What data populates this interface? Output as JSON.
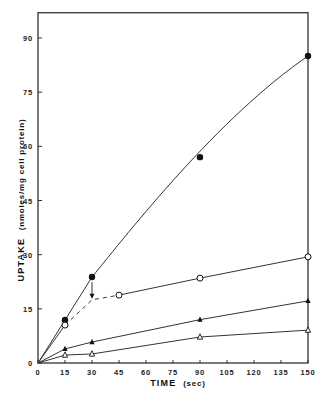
{
  "chart_data": {
    "type": "line",
    "title": "",
    "xlabel": "TIME (sec)",
    "ylabel_main": "UPTAKE",
    "ylabel_units": "(nmoles/mg cell protein)",
    "xlim": [
      0,
      150
    ],
    "ylim": [
      0,
      97
    ],
    "x_ticks": [
      0,
      15,
      30,
      45,
      60,
      75,
      90,
      105,
      120,
      135,
      150
    ],
    "y_ticks": [
      0,
      15,
      30,
      45,
      60,
      75,
      90
    ],
    "grid": false,
    "legend": "none",
    "series": [
      {
        "name": "filled circles",
        "marker": "filled-circle",
        "line": "solid smooth curve",
        "x": [
          0,
          15,
          30,
          90,
          150
        ],
        "y": [
          0,
          11.9,
          23.8,
          57,
          85
        ]
      },
      {
        "name": "open circles",
        "marker": "open-circle",
        "line": "solid 0-15, dashed 15-45 (arrow from filled 30s point down to 30s), solid 45-150",
        "x": [
          0,
          15,
          30,
          45,
          90,
          150
        ],
        "y": [
          0,
          10.5,
          17.5,
          18.8,
          23.5,
          29.4
        ]
      },
      {
        "name": "filled triangles",
        "marker": "filled-triangle",
        "line": "solid",
        "x": [
          0,
          15,
          30,
          90,
          150
        ],
        "y": [
          0,
          3.9,
          5.8,
          12,
          17.2
        ]
      },
      {
        "name": "open triangles",
        "marker": "open-triangle",
        "line": "solid",
        "x": [
          0,
          15,
          30,
          90,
          150
        ],
        "y": [
          0,
          2.2,
          2.5,
          7.2,
          9.1
        ]
      }
    ],
    "annotations": [
      {
        "type": "arrow",
        "from": [
          30,
          23.8
        ],
        "to": [
          30,
          17.5
        ],
        "note": "transition from filled-circle curve to open-circle curve at 30 sec"
      }
    ]
  },
  "labels": {
    "x_title": "TIME",
    "x_units": "(sec)",
    "y_title": "UPTAKE",
    "y_units": "(nmoles/mg cell protein)"
  }
}
